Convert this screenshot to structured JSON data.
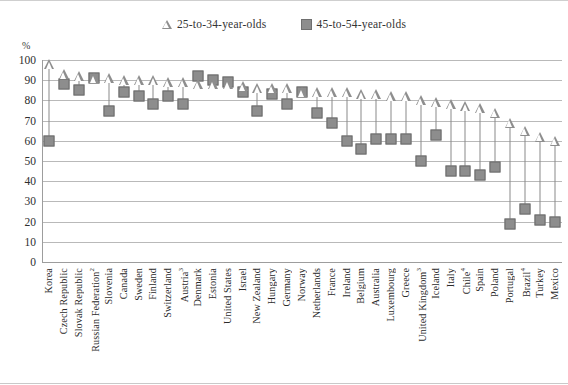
{
  "legend": {
    "entries": [
      {
        "label": "25-to-34-year-olds",
        "marker": "triangle-outline-icon"
      },
      {
        "label": "45-to-54-year-olds",
        "marker": "square-filled-icon"
      }
    ]
  },
  "axis": {
    "unit": "%",
    "y_ticks": [
      "100",
      "90",
      "80",
      "70",
      "60",
      "50",
      "40",
      "30",
      "20",
      "10",
      "0"
    ]
  },
  "colors": {
    "marker_fill": "#8d8d8d",
    "marker_stroke": "#6b6b6b",
    "stem": "#8a8a8a",
    "grid": "#b9b9b9"
  },
  "chart_data": {
    "type": "scatter",
    "title": "",
    "subtitle": "",
    "xlabel": "",
    "ylabel": "%",
    "ylim": [
      0,
      100
    ],
    "ytick_step": 10,
    "grid": true,
    "legend_position": "top-center",
    "categories": [
      "Korea",
      "Czech Republic",
      "Slovak Republic",
      "Russian Federation²",
      "Slovenia",
      "Canada",
      "Sweden",
      "Finland",
      "Switzerland",
      "Austria³",
      "Denmark",
      "Estonia",
      "United States",
      "Israel",
      "New Zealand",
      "Hungary",
      "Germany",
      "Norway",
      "Netherlands",
      "France",
      "Ireland",
      "Belgium",
      "Australia",
      "Luxembourg",
      "Greece",
      "United Kingdom³",
      "Iceland",
      "Italy",
      "Chile⁴",
      "Spain",
      "Poland",
      "Portugal",
      "Brazil⁴",
      "Turkey",
      "Mexico"
    ],
    "series": [
      {
        "name": "25-to-34-year-olds",
        "marker": "triangle",
        "values": [
          98,
          93,
          92,
          91,
          91,
          90,
          90,
          90,
          89,
          89,
          88,
          88,
          88,
          87,
          86,
          86,
          86,
          84,
          84,
          84,
          84,
          83,
          83,
          82,
          82,
          80,
          79,
          78,
          77,
          76,
          74,
          69,
          65,
          62,
          60
        ]
      },
      {
        "name": "45-to-54-year-olds",
        "marker": "square",
        "values": [
          60,
          88,
          85,
          91,
          75,
          84,
          82,
          78,
          82,
          78,
          92,
          90,
          89,
          84,
          75,
          83,
          78,
          84,
          74,
          69,
          60,
          56,
          61,
          61,
          61,
          50,
          63,
          45,
          45,
          43,
          47,
          19,
          26,
          21,
          20
        ]
      }
    ]
  }
}
